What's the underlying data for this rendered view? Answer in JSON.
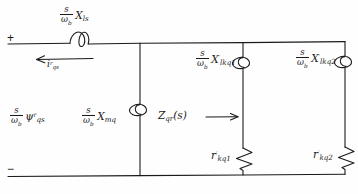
{
  "diagram": {
    "ink_color": "#1a1a1a",
    "background": "#fefefe"
  },
  "terminals": {
    "positive": "+",
    "negative": "−"
  },
  "labels": {
    "series_inductor": {
      "numerator": "s",
      "denominator_base": "ω",
      "denominator_sub": "b",
      "symbol": "X",
      "symbol_sub": "ls",
      "symbol_prime": ""
    },
    "current_arrow": {
      "symbol": "i",
      "symbol_sub": "qs",
      "symbol_prime": "r",
      "direction": "left"
    },
    "flux_source": {
      "numerator": "s",
      "denominator_base": "ω",
      "denominator_sub": "b",
      "symbol": "ψ",
      "symbol_sub": "qs",
      "symbol_prime": "r"
    },
    "magnetizing": {
      "numerator": "s",
      "denominator_base": "ω",
      "denominator_sub": "b",
      "symbol": "X",
      "symbol_sub": "mq",
      "symbol_prime": ""
    },
    "impedance_arrow": {
      "symbol": "Z",
      "symbol_sub": "qr",
      "argument": "(s)",
      "direction": "right"
    },
    "damper1_reactance": {
      "numerator": "s",
      "denominator_base": "ω",
      "denominator_sub": "b",
      "symbol": "X",
      "symbol_sub": "lkq1",
      "symbol_prime": "′"
    },
    "damper2_reactance": {
      "numerator": "s",
      "denominator_base": "ω",
      "denominator_sub": "b",
      "symbol": "X",
      "symbol_sub": "lkq2",
      "symbol_prime": "′"
    },
    "damper1_resistance": {
      "symbol": "r",
      "symbol_sub": "kq1",
      "symbol_prime": "′"
    },
    "damper2_resistance": {
      "symbol": "r",
      "symbol_sub": "kq2",
      "symbol_prime": "′"
    }
  }
}
